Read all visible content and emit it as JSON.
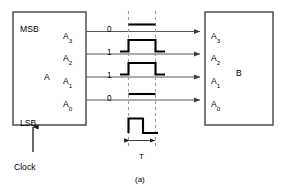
{
  "figure": {
    "caption": "(a)",
    "title_implicit": "4-bit parallel data transfer between registers"
  },
  "register_a": {
    "name": "A",
    "msb_label": "MSB",
    "lsb_label": "LSB",
    "clock_label": "Clock",
    "ports": [
      {
        "base": "A",
        "sub": "3"
      },
      {
        "base": "A",
        "sub": "2"
      },
      {
        "base": "A",
        "sub": "1"
      },
      {
        "base": "A",
        "sub": "0"
      }
    ]
  },
  "register_b": {
    "name": "B",
    "ports": [
      {
        "base": "A",
        "sub": "3"
      },
      {
        "base": "A",
        "sub": "2"
      },
      {
        "base": "A",
        "sub": "1"
      },
      {
        "base": "A",
        "sub": "0"
      }
    ]
  },
  "bit_values": [
    "0",
    "1",
    "1",
    "0"
  ],
  "timing": {
    "period_label": "T",
    "clock_waveform": "single-positive-pulse"
  },
  "waveforms": [
    {
      "line": "A3",
      "value": "0",
      "shape": "low"
    },
    {
      "line": "A2",
      "value": "1",
      "shape": "high-pulse"
    },
    {
      "line": "A1",
      "value": "1",
      "shape": "high-pulse"
    },
    {
      "line": "A0",
      "value": "0",
      "shape": "low"
    }
  ],
  "colors": {
    "box_stroke": "#58585a",
    "signal_stroke": "#5b5b5d",
    "wave_stroke": "#000000",
    "dash_stroke": "#9a9a9c",
    "text": "#1a1a1a",
    "background": "#ffffff"
  }
}
